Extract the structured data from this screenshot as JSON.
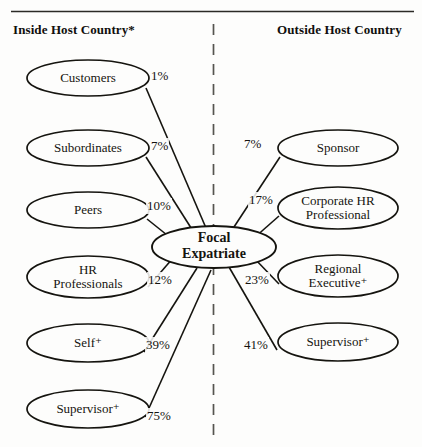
{
  "figure": {
    "title_left": "Inside Host Country*",
    "title_right": "Outside Host Country",
    "divider": "dashed-vertical-line",
    "top_rule": "horizontal-rule"
  },
  "center_node": {
    "id": "focal-expatriate",
    "line1": "Focal",
    "line2": "Expatriate",
    "cx": 214,
    "cy": 247,
    "rx": 62,
    "ry": 21
  },
  "inside_nodes": [
    {
      "id": "customers",
      "line1": "Customers",
      "line2": "",
      "pct": "1%",
      "cx": 88,
      "cy": 78,
      "rx": 61,
      "ry": 18,
      "pct_x": 150,
      "pct_y": 68
    },
    {
      "id": "subordinates",
      "line1": "Subordinates",
      "line2": "",
      "pct": "7%",
      "cx": 88,
      "cy": 148,
      "rx": 61,
      "ry": 18,
      "pct_x": 150,
      "pct_y": 138
    },
    {
      "id": "peers",
      "line1": "Peers",
      "line2": "",
      "pct": "10%",
      "cx": 88,
      "cy": 210,
      "rx": 61,
      "ry": 18,
      "pct_x": 146,
      "pct_y": 198
    },
    {
      "id": "hr-professionals",
      "line1": "HR",
      "line2": "Professionals",
      "pct": "12%",
      "cx": 88,
      "cy": 277,
      "rx": 61,
      "ry": 21,
      "pct_x": 147,
      "pct_y": 272
    },
    {
      "id": "self",
      "line1": "Self⁺",
      "line2": "",
      "pct": "39%",
      "cx": 88,
      "cy": 343,
      "rx": 61,
      "ry": 19,
      "pct_x": 145,
      "pct_y": 337
    },
    {
      "id": "supervisor-in",
      "line1": "Supervisor⁺",
      "line2": "",
      "pct": "75%",
      "cx": 88,
      "cy": 409,
      "rx": 61,
      "ry": 19,
      "pct_x": 146,
      "pct_y": 408
    }
  ],
  "outside_nodes": [
    {
      "id": "sponsor",
      "line1": "Sponsor",
      "line2": "",
      "pct": "7%",
      "cx": 338,
      "cy": 148,
      "rx": 60,
      "ry": 18,
      "pct_x": 243,
      "pct_y": 136
    },
    {
      "id": "corporate-hr",
      "line1": "Corporate HR",
      "line2": "Professional",
      "pct": "17%",
      "cx": 338,
      "cy": 208,
      "rx": 60,
      "ry": 21,
      "pct_x": 248,
      "pct_y": 192
    },
    {
      "id": "regional-executive",
      "line1": "Regional",
      "line2": "Executive⁺",
      "pct": "23%",
      "cx": 338,
      "cy": 276,
      "rx": 60,
      "ry": 21,
      "pct_x": 244,
      "pct_y": 272
    },
    {
      "id": "supervisor-out",
      "line1": "Supervisor⁺",
      "line2": "",
      "pct": "41%",
      "cx": 338,
      "cy": 342,
      "rx": 60,
      "ry": 19,
      "pct_x": 243,
      "pct_y": 337
    }
  ],
  "chart_data": {
    "type": "diagram",
    "groups": [
      {
        "name": "Inside Host Country*",
        "items": [
          {
            "label": "Customers",
            "value": 1
          },
          {
            "label": "Subordinates",
            "value": 7
          },
          {
            "label": "Peers",
            "value": 10
          },
          {
            "label": "HR Professionals",
            "value": 12
          },
          {
            "label": "Self+",
            "value": 39
          },
          {
            "label": "Supervisor+",
            "value": 75
          }
        ]
      },
      {
        "name": "Outside Host Country",
        "items": [
          {
            "label": "Sponsor",
            "value": 7
          },
          {
            "label": "Corporate HR Professional",
            "value": 17
          },
          {
            "label": "Regional Executive+",
            "value": 23
          },
          {
            "label": "Supervisor+",
            "value": 41
          }
        ]
      }
    ],
    "center": "Focal Expatriate",
    "unit": "%"
  },
  "colors": {
    "stroke": "#15140f",
    "text": "#15140f",
    "background": "#fdfdfc",
    "divider": "#55544f"
  }
}
